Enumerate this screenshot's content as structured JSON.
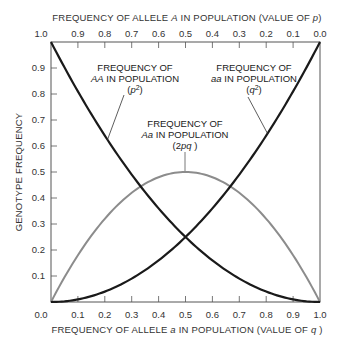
{
  "chart_data": {
    "type": "line",
    "title": "",
    "top_xlabel": "FREQUENCY OF ALLELE A IN POPULATION (VALUE OF p)",
    "xlabel": "FREQUENCY OF ALLELE a IN POPULATION (VALUE OF q )",
    "ylabel": "GENOTYPE FREQUENCY",
    "xlim": [
      0,
      1
    ],
    "ylim": [
      0,
      1
    ],
    "grid": false,
    "bottom_ticks": [
      "0.0",
      "0.1",
      "0.2",
      "0.3",
      "0.4",
      "0.5",
      "0.6",
      "0.7",
      "0.8",
      "0.9",
      "1.0"
    ],
    "top_ticks": [
      "1.0",
      "0.9",
      "0.8",
      "0.7",
      "0.6",
      "0.5",
      "0.4",
      "0.3",
      "0.2",
      "0.1",
      "0.0"
    ],
    "left_ticks": [
      "0.0",
      "0.1",
      "0.2",
      "0.3",
      "0.4",
      "0.5",
      "0.6",
      "0.7",
      "0.8",
      "0.9",
      "1.0"
    ],
    "x": [
      0.0,
      0.1,
      0.2,
      0.3,
      0.4,
      0.5,
      0.6,
      0.7,
      0.8,
      0.9,
      1.0
    ],
    "series": [
      {
        "name": "AA (p^2)",
        "color": "#1a1a1a",
        "values": [
          1.0,
          0.81,
          0.64,
          0.49,
          0.36,
          0.25,
          0.16,
          0.09,
          0.04,
          0.01,
          0.0
        ]
      },
      {
        "name": "aa (q^2)",
        "color": "#1a1a1a",
        "values": [
          0.0,
          0.01,
          0.04,
          0.09,
          0.16,
          0.25,
          0.36,
          0.49,
          0.64,
          0.81,
          1.0
        ]
      },
      {
        "name": "Aa (2pq)",
        "color": "#8c8c8c",
        "values": [
          0.0,
          0.18,
          0.32,
          0.42,
          0.48,
          0.5,
          0.48,
          0.42,
          0.32,
          0.18,
          0.0
        ]
      }
    ],
    "annotations": [
      {
        "lines": [
          "FREQUENCY OF",
          "AA IN POPULATION",
          "(p2)"
        ],
        "target": "AA (p^2)"
      },
      {
        "lines": [
          "FREQUENCY OF",
          "aa IN POPULATION",
          "(q2)"
        ],
        "target": "aa (q^2)"
      },
      {
        "lines": [
          "FREQUENCY OF",
          "Aa IN POPULATION",
          "(2pq )"
        ],
        "target": "Aa (2pq)"
      }
    ]
  },
  "labels": {
    "top_title_pre": "FREQUENCY OF ALLELE ",
    "top_title_italic": "A",
    "top_title_mid": " IN POPULATION (VALUE OF ",
    "top_title_var": "p",
    "top_title_post": ")",
    "bottom_title_pre": "FREQUENCY OF ALLELE ",
    "bottom_title_italic": "a",
    "bottom_title_mid": " IN POPULATION (VALUE OF ",
    "bottom_title_var": "q",
    "bottom_title_post": " )",
    "y_title": "GENOTYPE FREQUENCY",
    "aa_dom": {
      "l1": "FREQUENCY OF",
      "l2_it": "AA",
      "l2": " IN POPULATION",
      "l3_open": "(",
      "l3_var": "p",
      "l3_sup": "2",
      "l3_close": ")"
    },
    "aa_rec": {
      "l1": "FREQUENCY OF",
      "l2_it": "aa",
      "l2": " IN POPULATION",
      "l3_open": "(",
      "l3_var": "q",
      "l3_sup": "2",
      "l3_close": ")"
    },
    "het": {
      "l1": "FREQUENCY OF",
      "l2_it": "Aa",
      "l2": " IN POPULATION",
      "l3_open": "(2",
      "l3_var": "pq",
      "l3_close": " )"
    }
  }
}
